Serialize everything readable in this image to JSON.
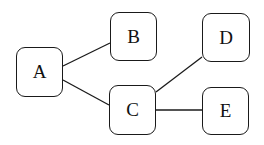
{
  "diagram": {
    "type": "tree",
    "nodes": [
      {
        "id": "A",
        "label": "A",
        "x": 16,
        "y": 47,
        "w": 47,
        "h": 50
      },
      {
        "id": "B",
        "label": "B",
        "x": 110,
        "y": 12,
        "w": 47,
        "h": 49
      },
      {
        "id": "C",
        "label": "C",
        "x": 109,
        "y": 85,
        "w": 47,
        "h": 50
      },
      {
        "id": "D",
        "label": "D",
        "x": 202,
        "y": 13,
        "w": 48,
        "h": 49
      },
      {
        "id": "E",
        "label": "E",
        "x": 202,
        "y": 87,
        "w": 47,
        "h": 48
      }
    ],
    "edges": [
      {
        "from": "A",
        "to": "B",
        "x1": 63,
        "y1": 66,
        "x2": 110,
        "y2": 43
      },
      {
        "from": "A",
        "to": "C",
        "x1": 63,
        "y1": 80,
        "x2": 109,
        "y2": 105
      },
      {
        "from": "C",
        "to": "D",
        "x1": 156,
        "y1": 92,
        "x2": 202,
        "y2": 57
      },
      {
        "from": "C",
        "to": "E",
        "x1": 156,
        "y1": 110,
        "x2": 202,
        "y2": 110
      }
    ],
    "colors": {
      "stroke": "#1a1a1a",
      "background": "#ffffff"
    }
  }
}
